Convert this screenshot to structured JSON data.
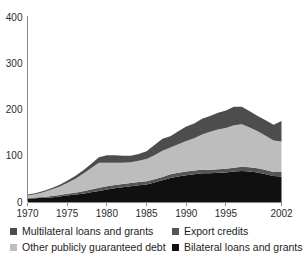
{
  "chart_data": {
    "type": "area",
    "stacked": true,
    "title": "",
    "subtitle": "",
    "xlabel": "",
    "ylabel": "",
    "grid": false,
    "legend_position": "bottom",
    "xlim": [
      1970,
      2002
    ],
    "ylim": [
      0,
      400
    ],
    "x_tick_labels": [
      "1970",
      "1975",
      "1980",
      "1985",
      "1990",
      "1995",
      "2002"
    ],
    "x_tick_values": [
      1970,
      1975,
      1980,
      1985,
      1990,
      1995,
      2002
    ],
    "y_tick_labels": [
      "0",
      "100",
      "200",
      "300",
      "400"
    ],
    "y_tick_values": [
      0,
      100,
      200,
      300,
      400
    ],
    "x": [
      1970,
      1971,
      1972,
      1973,
      1974,
      1975,
      1976,
      1977,
      1978,
      1979,
      1980,
      1981,
      1982,
      1983,
      1984,
      1985,
      1986,
      1987,
      1988,
      1989,
      1990,
      1991,
      1992,
      1993,
      1994,
      1995,
      1996,
      1997,
      1998,
      1999,
      2000,
      2001,
      2002
    ],
    "series": [
      {
        "name": "Bilateral loans and grants",
        "color": "#101010",
        "stack_order": 1,
        "values": [
          7,
          8,
          9,
          10,
          12,
          14,
          16,
          18,
          21,
          24,
          27,
          30,
          32,
          34,
          36,
          38,
          42,
          47,
          52,
          55,
          58,
          60,
          62,
          62,
          63,
          64,
          66,
          67,
          66,
          64,
          60,
          56,
          55
        ]
      },
      {
        "name": "Export credits",
        "color": "#555555",
        "stack_order": 2,
        "values": [
          2,
          2,
          2,
          3,
          3,
          4,
          4,
          5,
          6,
          7,
          7,
          7,
          7,
          7,
          7,
          7,
          7,
          7,
          8,
          8,
          8,
          8,
          8,
          8,
          8,
          8,
          8,
          9,
          9,
          9,
          9,
          9,
          10
        ]
      },
      {
        "name": "Other publicly guaranteed debt",
        "color": "#bdbdbd",
        "stack_order": 3,
        "values": [
          5,
          7,
          10,
          14,
          18,
          23,
          30,
          38,
          46,
          54,
          51,
          48,
          46,
          45,
          46,
          48,
          52,
          57,
          58,
          62,
          66,
          70,
          76,
          82,
          86,
          88,
          92,
          92,
          86,
          80,
          74,
          68,
          66
        ]
      },
      {
        "name": "Multilateral loans and grants",
        "color": "#4d4d4d",
        "stack_order": 4,
        "values": [
          2,
          2,
          3,
          3,
          4,
          5,
          6,
          7,
          9,
          12,
          16,
          16,
          15,
          14,
          15,
          17,
          22,
          26,
          24,
          28,
          31,
          32,
          34,
          34,
          36,
          38,
          40,
          38,
          35,
          33,
          34,
          34,
          44
        ]
      }
    ],
    "totals": [
      16,
      19,
      24,
      30,
      37,
      46,
      56,
      68,
      82,
      97,
      101,
      101,
      100,
      100,
      104,
      110,
      123,
      137,
      142,
      153,
      163,
      170,
      180,
      186,
      193,
      198,
      206,
      206,
      196,
      186,
      177,
      167,
      175
    ]
  },
  "legend": {
    "items": [
      {
        "label": "Multilateral loans and grants",
        "color": "#4d4d4d"
      },
      {
        "label": "Export credits",
        "color": "#555555"
      },
      {
        "label": "Other publicly guaranteed debt",
        "color": "#bdbdbd"
      },
      {
        "label": "Bilateral loans and grants",
        "color": "#101010"
      }
    ]
  }
}
